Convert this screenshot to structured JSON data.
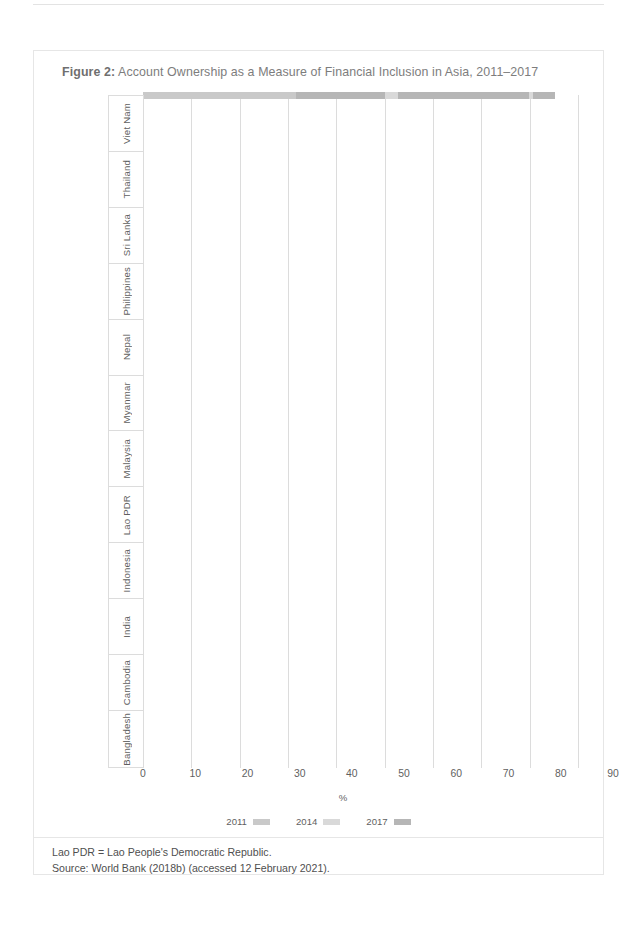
{
  "figure": {
    "label": "Figure 2:",
    "title": "Account Ownership as a Measure of Financial Inclusion in Asia, 2011–2017"
  },
  "footnotes": {
    "abbreviation": "Lao PDR = Lao People's Democratic Republic.",
    "source": "Source: World Bank (2018b) (accessed 12 February 2021)."
  },
  "legend": {
    "position": "bottom-center",
    "items": [
      {
        "label": "2011",
        "color": "#c9c9c9"
      },
      {
        "label": "2014",
        "color": "#d9d9d9"
      },
      {
        "label": "2017",
        "color": "#b6b6b6"
      }
    ]
  },
  "chart_data": {
    "type": "bar",
    "orientation": "horizontal",
    "title": "Account Ownership as a Measure of Financial Inclusion in Asia, 2011–2017",
    "xlabel": "%",
    "ylabel": "",
    "xlim": [
      0,
      90
    ],
    "xticks": [
      0,
      10,
      20,
      30,
      40,
      50,
      60,
      70,
      80,
      90
    ],
    "grid": true,
    "grid_axis": "x",
    "bar_order_top_to_bottom": [
      "2017",
      "2014",
      "2011"
    ],
    "categories": [
      "Viet Nam",
      "Thailand",
      "Sri Lanka",
      "Philippines",
      "Nepal",
      "Myanmar",
      "Malaysia",
      "Lao PDR",
      "Indonesia",
      "India",
      "Cambodia",
      "Bangladesh"
    ],
    "series": [
      {
        "name": "2011",
        "color": "#c9c9c9",
        "values": [
          21.4,
          72.7,
          68.5,
          26.6,
          25.3,
          null,
          66.2,
          26.8,
          19.6,
          35.2,
          3.7,
          31.7
        ]
      },
      {
        "name": "2014",
        "color": "#d9d9d9",
        "values": [
          30.9,
          78.1,
          82.2,
          31.3,
          33.8,
          22.8,
          80.7,
          null,
          36.1,
          52.8,
          22.2,
          31.0
        ]
      },
      {
        "name": "2017",
        "color": "#b6b6b6",
        "values": [
          30.8,
          81.6,
          73.6,
          34.5,
          45.4,
          26.0,
          85.3,
          29.1,
          48.9,
          79.9,
          21.7,
          50.0
        ]
      }
    ]
  }
}
